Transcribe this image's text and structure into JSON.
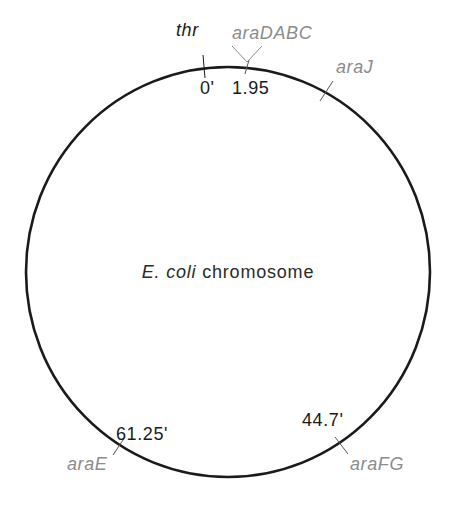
{
  "diagram": {
    "type": "circular-chromosome-map",
    "title_italic": "E. coli",
    "title_rest": " chromosome",
    "colors": {
      "circle": "#1a1a1a",
      "position_text": "#1a1a1a",
      "ara_gene_text": "#8c8c8c",
      "reference_gene_text": "#1a1a1a"
    },
    "circle": {
      "cx": 228,
      "cy": 272,
      "r": 204
    },
    "loci": [
      {
        "gene": "thr",
        "position": "0'",
        "style": "reference"
      },
      {
        "gene": "araDABC",
        "position": "1.95",
        "style": "ara"
      },
      {
        "gene": "araJ",
        "position": "",
        "style": "ara"
      },
      {
        "gene": "araFG",
        "position": "44.7'",
        "style": "ara"
      },
      {
        "gene": "araE",
        "position": "61.25'",
        "style": "ara"
      }
    ]
  }
}
